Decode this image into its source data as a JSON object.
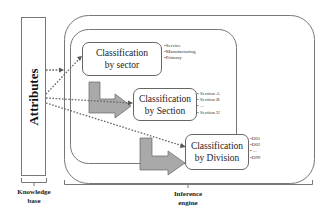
{
  "knowledge_base": {
    "box_label": "Attributes",
    "caption_line1": "Knowledge",
    "caption_line2": "base"
  },
  "inference_engine": {
    "caption_line1": "Inference",
    "caption_line2": "engine"
  },
  "classifiers": [
    {
      "title_line1": "Classification",
      "title_line2": "by sector",
      "items": [
        "•Service",
        "•Manufacturing",
        "•Primary"
      ]
    },
    {
      "title_line1": "Classification",
      "title_line2": "by Section",
      "items": [
        "• Section A",
        "• Section B",
        "• ...",
        "• Section U"
      ]
    },
    {
      "title_line1": "Classification",
      "title_line2": "by Division",
      "items": [
        "•D01",
        "•D02",
        "• ...",
        "•D99"
      ]
    }
  ],
  "colors": {
    "arrow_fill": "#a9a9a9",
    "arrow_stroke": "#666666",
    "dotted_line": "#666666",
    "box_border": "#666666"
  }
}
